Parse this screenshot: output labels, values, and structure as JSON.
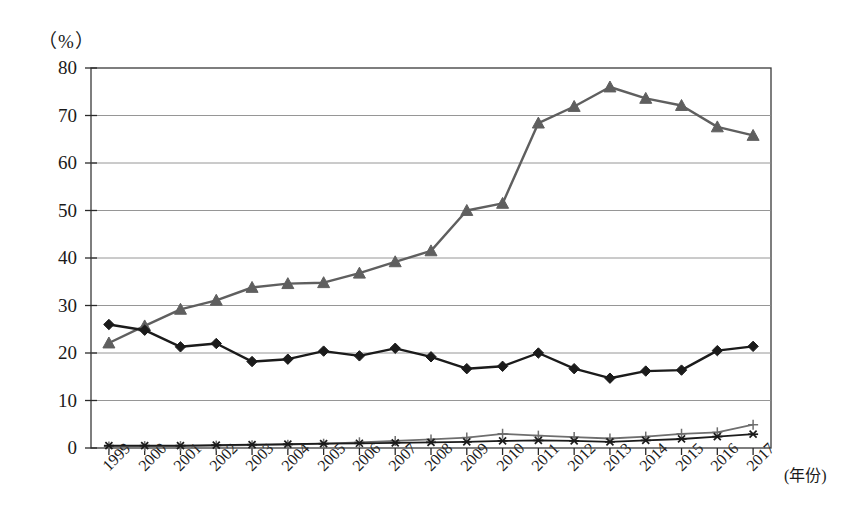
{
  "chart_data": {
    "type": "line",
    "title": "",
    "subtitle": "",
    "xlabel": "(年份)",
    "ylabel": "（%）",
    "ylim": [
      0,
      80
    ],
    "ytick_step": 10,
    "yticks": [
      0,
      10,
      20,
      30,
      40,
      50,
      60,
      70,
      80
    ],
    "grid": true,
    "legend": "none",
    "x": [
      1999,
      2000,
      2001,
      2002,
      2003,
      2004,
      2005,
      2006,
      2007,
      2008,
      2009,
      2010,
      2011,
      2012,
      2013,
      2014,
      2015,
      2016,
      2017
    ],
    "categories": [
      "1999",
      "2000",
      "2001",
      "2002",
      "2003",
      "2004",
      "2005",
      "2006",
      "2007",
      "2008",
      "2009",
      "2010",
      "2011",
      "2012",
      "2013",
      "2014",
      "2015",
      "2016",
      "2017"
    ],
    "series": [
      {
        "name": "series-diamond-dark",
        "marker": "diamond",
        "color": "#1b1b1b",
        "values": [
          26.0,
          24.8,
          21.3,
          22.0,
          18.2,
          18.7,
          20.4,
          19.4,
          21.0,
          19.2,
          16.7,
          17.2,
          20.0,
          16.7,
          14.7,
          16.2,
          16.4,
          20.5,
          21.4
        ]
      },
      {
        "name": "series-triangle-gray",
        "marker": "triangle",
        "color": "#5f5f5f",
        "values": [
          22.1,
          25.7,
          29.2,
          31.1,
          33.8,
          34.6,
          34.8,
          36.8,
          39.2,
          41.5,
          50.0,
          51.5,
          68.4,
          71.9,
          76.0,
          73.6,
          72.1,
          67.6,
          65.8
        ]
      },
      {
        "name": "series-star-dark",
        "marker": "star",
        "color": "#1b1b1b",
        "values": [
          0.5,
          0.5,
          0.5,
          0.6,
          0.7,
          0.8,
          0.9,
          1.0,
          1.1,
          1.2,
          1.3,
          1.5,
          1.6,
          1.5,
          1.3,
          1.6,
          1.9,
          2.4,
          2.9
        ]
      },
      {
        "name": "series-plus-gray",
        "marker": "plus",
        "color": "#6e6e6e",
        "values": [
          0.3,
          0.4,
          0.4,
          0.5,
          0.6,
          0.7,
          0.9,
          1.2,
          1.5,
          1.8,
          2.2,
          3.0,
          2.6,
          2.3,
          2.0,
          2.4,
          3.0,
          3.3,
          4.9
        ]
      }
    ]
  },
  "axes": {
    "y_unit": "（%）",
    "x_name": "(年份)"
  }
}
